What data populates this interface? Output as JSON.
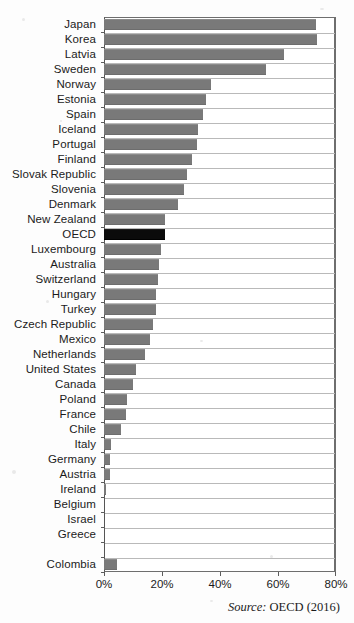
{
  "chart_data": {
    "type": "bar",
    "orientation": "horizontal",
    "title": "",
    "xlabel": "",
    "ylabel": "",
    "xlim": [
      0,
      80
    ],
    "xticks": [
      "0%",
      "20%",
      "40%",
      "60%",
      "80%"
    ],
    "xtick_values": [
      0,
      20,
      40,
      60,
      80
    ],
    "grid": "horizontal-row-separators",
    "legend": "none",
    "highlight_category": "OECD",
    "colors": {
      "bar": "#797979",
      "highlight_bar": "#0b0b0b",
      "axis": "#5d5d5d",
      "gridline": "#b9b9b9",
      "text": "#1b1b1b",
      "background": "#ffffff"
    },
    "categories": [
      "Japan",
      "Korea",
      "Latvia",
      "Sweden",
      "Norway",
      "Estonia",
      "Spain",
      "Iceland",
      "Portugal",
      "Finland",
      "Slovak Republic",
      "Slovenia",
      "Denmark",
      "New Zealand",
      "OECD",
      "Luxembourg",
      "Australia",
      "Switzerland",
      "Hungary",
      "Turkey",
      "Czech Republic",
      "Mexico",
      "Netherlands",
      "United States",
      "Canada",
      "Poland",
      "France",
      "Chile",
      "Italy",
      "Germany",
      "Austria",
      "Ireland",
      "Belgium",
      "Israel",
      "Greece",
      "",
      "Colombia"
    ],
    "values": [
      73.0,
      73.5,
      62.0,
      56.0,
      37.0,
      35.0,
      34.0,
      32.5,
      32.0,
      30.5,
      28.5,
      27.5,
      25.5,
      21.0,
      21.0,
      19.5,
      19.0,
      18.5,
      18.0,
      18.0,
      17.0,
      16.0,
      14.0,
      11.0,
      10.0,
      8.0,
      7.5,
      6.0,
      2.5,
      2.0,
      2.0,
      0.7,
      0.0,
      0.0,
      0.0,
      0.0,
      4.5
    ],
    "value_unit": "%"
  },
  "footer": {
    "source_label": "Source:",
    "source_text": " OECD (2016)"
  }
}
